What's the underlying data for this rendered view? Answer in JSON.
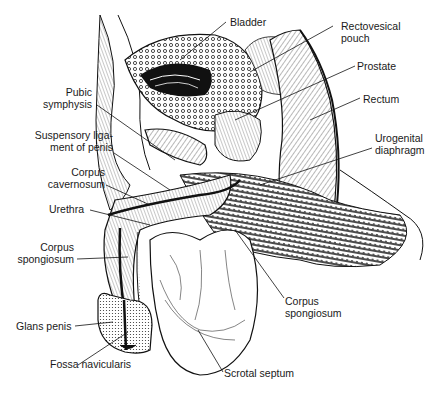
{
  "figure": {
    "labels": [
      {
        "id": "bladder",
        "lines": [
          "Bladder"
        ]
      },
      {
        "id": "rectovesical-pouch",
        "lines": [
          "Rectovesical",
          "pouch"
        ]
      },
      {
        "id": "prostate",
        "lines": [
          "Prostate"
        ]
      },
      {
        "id": "rectum",
        "lines": [
          "Rectum"
        ]
      },
      {
        "id": "urogenital-diaphragm",
        "lines": [
          "Urogenital",
          "diaphragm"
        ]
      },
      {
        "id": "pubic-symphysis",
        "lines": [
          "Pubic",
          "symphysis"
        ]
      },
      {
        "id": "suspensory-ligament",
        "lines": [
          "Suspensory liga-",
          "ment of penis"
        ]
      },
      {
        "id": "corpus-cavernosum",
        "lines": [
          "Corpus",
          "cavernosum"
        ]
      },
      {
        "id": "urethra",
        "lines": [
          "Urethra"
        ]
      },
      {
        "id": "corpus-spongiosum-left",
        "lines": [
          "Corpus",
          "spongiosum"
        ]
      },
      {
        "id": "glans-penis",
        "lines": [
          "Glans penis"
        ]
      },
      {
        "id": "fossa-navicularis",
        "lines": [
          "Fossa navicularis"
        ]
      },
      {
        "id": "corpus-spongiosum-right",
        "lines": [
          "Corpus",
          "spongiosum"
        ]
      },
      {
        "id": "scrotal-septum",
        "lines": [
          "Scrotal septum"
        ]
      }
    ]
  }
}
